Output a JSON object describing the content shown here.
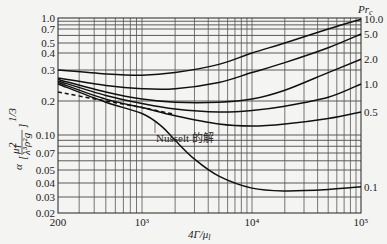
{
  "chart_data": {
    "type": "line",
    "title": "",
    "xlabel": "4Γ/μ_l",
    "ylabel": "α [μ_l² / (λ_l³ ρ_l² g)]^(1/3)",
    "xscale": "log",
    "yscale": "log",
    "xlim": [
      200,
      100000
    ],
    "ylim": [
      0.02,
      1.0
    ],
    "grid": true,
    "x_tick_labels": [
      "200",
      "10³",
      "10⁴",
      "10⁵"
    ],
    "y_tick_labels": [
      "1.0",
      "0.7",
      "0.5",
      "0.4",
      "0.3",
      "0.2",
      "0.10",
      "0.07",
      "0.05",
      "0.04",
      "0.03",
      "0.02"
    ],
    "legend_title": "Pr_c",
    "series": [
      {
        "name": "10.0",
        "x": [
          200,
          500,
          1000,
          2000,
          5000,
          10000,
          20000,
          50000,
          100000
        ],
        "values": [
          0.3,
          0.285,
          0.28,
          0.29,
          0.33,
          0.4,
          0.5,
          0.7,
          0.96
        ]
      },
      {
        "name": "5.0",
        "x": [
          200,
          500,
          1000,
          2000,
          5000,
          10000,
          20000,
          50000,
          100000
        ],
        "values": [
          0.27,
          0.245,
          0.235,
          0.235,
          0.255,
          0.29,
          0.34,
          0.45,
          0.62
        ]
      },
      {
        "name": "2.0",
        "x": [
          200,
          500,
          1000,
          2000,
          5000,
          10000,
          20000,
          50000,
          100000
        ],
        "values": [
          0.265,
          0.225,
          0.205,
          0.195,
          0.195,
          0.205,
          0.23,
          0.29,
          0.36
        ]
      },
      {
        "name": "1.0",
        "x": [
          200,
          500,
          1000,
          2000,
          5000,
          10000,
          20000,
          50000,
          100000
        ],
        "values": [
          0.26,
          0.215,
          0.19,
          0.17,
          0.16,
          0.165,
          0.18,
          0.21,
          0.25
        ]
      },
      {
        "name": "0.5",
        "x": [
          200,
          500,
          1000,
          2000,
          5000,
          10000,
          20000,
          50000,
          100000
        ],
        "values": [
          0.255,
          0.205,
          0.175,
          0.148,
          0.125,
          0.12,
          0.125,
          0.14,
          0.16
        ]
      },
      {
        "name": "0.1",
        "x": [
          200,
          500,
          1000,
          1500,
          2000,
          3000,
          5000,
          10000,
          20000,
          50000,
          100000
        ],
        "values": [
          0.25,
          0.195,
          0.155,
          0.12,
          0.09,
          0.062,
          0.045,
          0.036,
          0.034,
          0.035,
          0.037
        ]
      },
      {
        "name": "Nusselt 的解",
        "style": "dashed",
        "x": [
          200,
          500,
          1000,
          2000
        ],
        "values": [
          0.225,
          0.2,
          0.175,
          0.152
        ]
      }
    ],
    "annotations": [
      {
        "text": "Nusselt 的解",
        "target": "dashed Nusselt solution line"
      }
    ]
  },
  "labels": {
    "pr_title": "Pr",
    "pr_sub": "c",
    "xlabel": "4Γ/μ",
    "xlabel_sub": "l",
    "nusselt": "Nusselt 的解",
    "ylabel_alpha": "α",
    "ylabel_exp": "1/3"
  }
}
